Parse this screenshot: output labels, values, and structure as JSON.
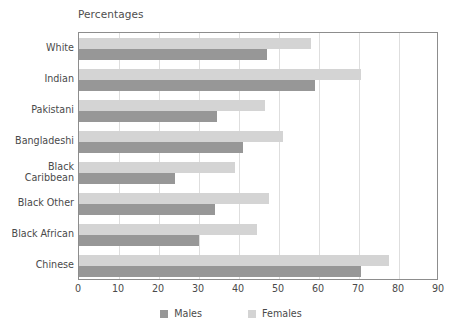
{
  "chart_data": {
    "type": "bar",
    "orientation": "horizontal",
    "title": "Percentages",
    "xlabel": "",
    "ylabel": "",
    "xlim": [
      0,
      90
    ],
    "xticks": [
      0,
      10,
      20,
      30,
      40,
      50,
      60,
      70,
      80,
      90
    ],
    "grid": true,
    "legend_position": "bottom",
    "categories": [
      "White",
      "Indian",
      "Pakistani",
      "Bangladeshi",
      "Black\nCaribbean",
      "Black Other",
      "Black African",
      "Chinese"
    ],
    "series": [
      {
        "name": "Males",
        "color": "#979797",
        "values": [
          47,
          59,
          34.5,
          41,
          24,
          34,
          30,
          70.5
        ]
      },
      {
        "name": "Females",
        "color": "#d4d4d4",
        "values": [
          58,
          70.5,
          46.5,
          51,
          39,
          47.5,
          44.5,
          77.5
        ]
      }
    ]
  },
  "legend": {
    "items": [
      {
        "label": "Males",
        "color": "#979797"
      },
      {
        "label": "Females",
        "color": "#d4d4d4"
      }
    ]
  },
  "colors": {
    "males": "#979797",
    "females": "#d4d4d4",
    "gridline": "#dedede",
    "frame": "#8d8d8d",
    "text": "#4a4a4a"
  }
}
